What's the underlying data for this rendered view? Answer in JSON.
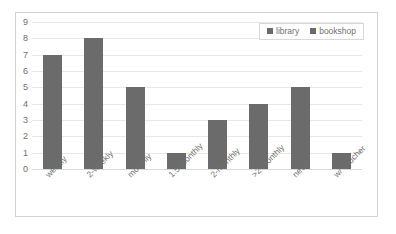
{
  "chart_data": {
    "type": "bar",
    "title": "",
    "subtitle": "",
    "xlabel": "",
    "ylabel": "",
    "categories": [
      "weekly",
      "2-weekly",
      "monthly",
      "1.5-monthly",
      "2-monthly",
      ">2-monthly",
      "never",
      "w/ voucher"
    ],
    "series": [
      {
        "name": "library",
        "values": [
          7,
          8,
          5,
          1,
          3,
          4,
          5,
          1
        ],
        "color": "#6b6b6b"
      },
      {
        "name": "bookshop",
        "values": [
          0,
          0,
          0,
          0,
          0,
          0,
          0,
          0
        ],
        "color": "#6b6b6b"
      }
    ],
    "ylim": [
      0,
      9
    ],
    "yticks": [
      0,
      1,
      2,
      3,
      4,
      5,
      6,
      7,
      8,
      9
    ],
    "ytick_labels": [
      "0",
      "1",
      "2",
      "3",
      "4",
      "5",
      "6",
      "7",
      "8",
      "9"
    ],
    "grid": true,
    "grid_axis": "y",
    "legend_position": "top-right",
    "annotations": []
  },
  "legend": {
    "entries": [
      {
        "label": "library",
        "marker": "square-marker",
        "color": "#6b6b6b"
      },
      {
        "label": "bookshop",
        "marker": "square-marker",
        "color": "#6b6b6b"
      }
    ]
  },
  "style": {
    "background": "#ffffff",
    "frame_border": "#d2d2d2",
    "gridline": "#e8e8e8",
    "axis_text": "#6f6f6f",
    "bar_color": "#6b6b6b"
  }
}
